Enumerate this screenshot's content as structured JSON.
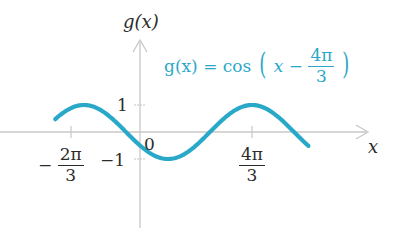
{
  "chart_data": {
    "type": "line",
    "title": "",
    "function": "g(x) = cos(x - 4π/3)",
    "xlabel": "x",
    "ylabel": "g(x)",
    "x_range": [
      -3.2,
      6.4
    ],
    "ylim": [
      -1,
      1
    ],
    "x_ticks": [
      {
        "value": -2.0944,
        "label": "-2π/3"
      },
      {
        "value": 0,
        "label": "0"
      },
      {
        "value": 4.1888,
        "label": "4π/3"
      }
    ],
    "y_ticks": [
      {
        "value": 1,
        "label": "1"
      },
      {
        "value": -1,
        "label": "-1"
      }
    ],
    "series": [
      {
        "name": "g(x) = cos(x - 4π/3)",
        "color": "#2aa8c8",
        "x": [
          -3.17,
          -2.0944,
          -0.5236,
          0,
          1.0472,
          2.618,
          4.1888,
          5.7596,
          6.3
        ],
        "values": [
          0.87,
          1,
          0,
          -0.5,
          -1,
          0,
          1,
          0,
          -0.85
        ]
      }
    ],
    "grid": false,
    "legend": {
      "position": "top-right",
      "text": "g(x) = cos(x − 4π/3)"
    },
    "colors": {
      "curve": "#2aa8c8",
      "axis": "#c8c8c8",
      "text": "#2b2b2b"
    }
  },
  "labels": {
    "y_axis": "g(x)",
    "x_axis": "x",
    "origin": "0",
    "y_one": "1",
    "y_neg_one": "−1",
    "x_neg_tick_sign": "−",
    "x_neg_tick_num": "2π",
    "x_neg_tick_den": "3",
    "x_pos_tick_num": "4π",
    "x_pos_tick_den": "3",
    "formula_lhs": "g(x) = cos",
    "formula_inner": "x −",
    "formula_num": "4π",
    "formula_den": "3",
    "paren_open": "(",
    "paren_close": ")"
  }
}
